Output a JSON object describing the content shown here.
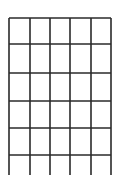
{
  "grid": {
    "stroke_color": "#2a2a2a",
    "background": "#ffffff",
    "columns": 5,
    "closed_rows": 5,
    "open_bottom_row": true,
    "vertical_lines_x": [
      9,
      30,
      50,
      70,
      91,
      111
    ],
    "horizontal_lines_y": [
      18,
      44,
      73,
      101,
      128,
      155
    ],
    "bottom_extent_y": 175
  }
}
